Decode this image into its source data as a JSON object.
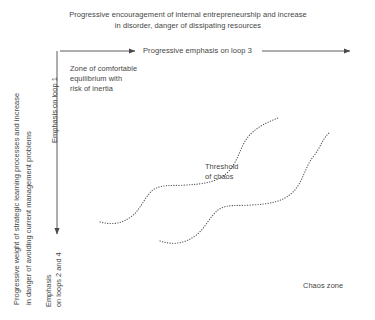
{
  "diagram": {
    "title": "Progressive encouragement of internal entrepreneurship and increase\nin disorder, danger of dissipating resources",
    "horizontal_axis": {
      "label": "Progressive emphasis on loop 3",
      "direction": "right",
      "arrow_left_segment": "x 60 to 141",
      "arrow_right_segment": "x 262 to 356"
    },
    "vertical_axis": {
      "outer_label": "Progressive weight of strategic learning processes and increase\nin danger of avoiding current management problems",
      "top_label": "Emphasis on loop 1",
      "bottom_label": "Emphasis\non loops 2 and 4",
      "direction": "down"
    },
    "annotations": {
      "zone_of_comfort": "Zone of comfortable\nequilibrium with\nrisk of inertia",
      "threshold_of_chaos": "Threshold\nof chaos",
      "chaos_zone": "Chaos zone"
    },
    "colors": {
      "background": "#ffffff",
      "text": "#454545",
      "axis_line": "#4a4a4a",
      "curve_dots": "#555555"
    }
  },
  "chart_data": {
    "type": "line",
    "title": "Progressive encouragement of internal entrepreneurship and increase in disorder, danger of dissipating resources",
    "xlabel": "Progressive emphasis on loop 3",
    "ylabel": "Progressive weight of strategic learning processes and increase in danger of avoiding current management problems",
    "xlim": [
      0,
      375
    ],
    "ylim": [
      320,
      0
    ],
    "grid": false,
    "legend": null,
    "line_style": "dotted",
    "series": [
      {
        "name": "upper-threshold-curve",
        "comment": "Upper dotted S-shaped staircase curve marking the threshold of chaos",
        "path": "M 100 222 C 112 225 122 224 132 216 C 141 209 145 196 153 190 C 161 184 173 186 186 185 C 204 184 218 182 228 172 C 238 162 240 147 248 137 C 256 127 268 122 278 118"
      },
      {
        "name": "lower-threshold-curve",
        "comment": "Lower dotted S-shaped staircase curve, parallel and offset down-right from the upper curve",
        "path": "M 160 241 C 172 245 184 244 195 236 C 205 229 210 216 218 210 C 226 204 238 206 251 205 C 269 204 283 202 293 192 C 303 182 305 167 313 157 C 321 147 322 139 330 132"
      }
    ],
    "annotations": [
      {
        "text": "Zone of comfortable equilibrium with risk of inertia",
        "x": 70,
        "y": 64
      },
      {
        "text": "Threshold of chaos",
        "x": 205,
        "y": 162
      },
      {
        "text": "Chaos zone",
        "x": 303,
        "y": 281
      }
    ]
  }
}
